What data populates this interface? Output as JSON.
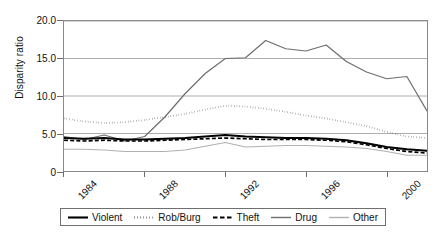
{
  "title_fragment": "",
  "axes": {
    "ylabel": "Disparity ratio",
    "yticks": [
      "20.0",
      "15.0",
      "10.0",
      "5.0",
      "0"
    ],
    "xticks": [
      "1984",
      "1988",
      "1992",
      "1996",
      "2000"
    ]
  },
  "legend": {
    "items": [
      {
        "label": "Violent",
        "style": "solid-thick",
        "color": "#000000"
      },
      {
        "label": "Rob/Burg",
        "style": "dotted",
        "color": "#1a1a1a"
      },
      {
        "label": "Theft",
        "style": "dashed",
        "color": "#000000"
      },
      {
        "label": "Drug",
        "style": "solid",
        "color": "#6e6e6e"
      },
      {
        "label": "Other",
        "style": "solid-light",
        "color": "#b0b0b0"
      }
    ]
  },
  "chart_data": {
    "type": "line",
    "title": "",
    "xlabel": "",
    "ylabel": "Disparity ratio",
    "xlim": [
      1984,
      2002
    ],
    "ylim": [
      0,
      20
    ],
    "yticks": [
      0,
      5,
      10,
      15,
      20
    ],
    "xticks": [
      1984,
      1988,
      1992,
      1996,
      2000
    ],
    "grid": "horizontal",
    "legend_position": "below",
    "x": [
      1984,
      1985,
      1986,
      1987,
      1988,
      1989,
      1990,
      1991,
      1992,
      1993,
      1994,
      1995,
      1996,
      1997,
      1998,
      1999,
      2000,
      2001,
      2002
    ],
    "series": [
      {
        "name": "Violent",
        "style": "solid-thick",
        "color": "#000000",
        "values": [
          4.4,
          4.3,
          4.4,
          4.2,
          4.2,
          4.3,
          4.4,
          4.6,
          4.8,
          4.6,
          4.5,
          4.4,
          4.4,
          4.3,
          4.1,
          3.7,
          3.2,
          2.9,
          2.7
        ]
      },
      {
        "name": "Rob/Burg",
        "style": "dotted",
        "color": "#1a1a1a",
        "values": [
          7.0,
          6.6,
          6.4,
          6.5,
          6.8,
          7.2,
          7.6,
          8.2,
          8.7,
          8.6,
          8.3,
          7.9,
          7.4,
          7.0,
          6.5,
          6.0,
          5.2,
          4.6,
          4.4
        ]
      },
      {
        "name": "Theft",
        "style": "dashed",
        "color": "#000000",
        "values": [
          4.1,
          4.0,
          4.1,
          4.0,
          4.0,
          4.1,
          4.2,
          4.3,
          4.4,
          4.3,
          4.2,
          4.2,
          4.2,
          4.1,
          3.9,
          3.5,
          3.0,
          2.6,
          2.4
        ]
      },
      {
        "name": "Drug",
        "style": "solid",
        "color": "#6e6e6e",
        "values": [
          4.6,
          4.2,
          4.8,
          4.0,
          4.6,
          7.2,
          10.3,
          13.0,
          15.0,
          15.1,
          17.4,
          16.3,
          16.0,
          16.8,
          14.6,
          13.2,
          12.3,
          12.6,
          8.0
        ]
      },
      {
        "name": "Other",
        "style": "solid-light",
        "color": "#b0b0b0",
        "values": [
          2.9,
          2.9,
          2.8,
          2.6,
          2.6,
          2.6,
          2.8,
          3.3,
          3.8,
          3.2,
          3.3,
          3.4,
          3.4,
          3.3,
          3.2,
          3.0,
          2.6,
          2.1,
          2.1
        ]
      }
    ]
  }
}
